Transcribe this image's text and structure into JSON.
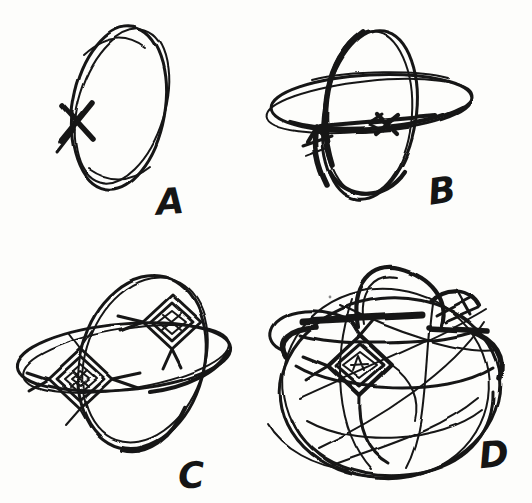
{
  "page": {
    "background_color": "#fdfdfb",
    "ink_color": "#151515"
  },
  "figure": {
    "type": "hand-drawn-sketch-sequence",
    "panels": [
      {
        "id": "A",
        "label": "A"
      },
      {
        "id": "B",
        "label": "B"
      },
      {
        "id": "C",
        "label": "C"
      },
      {
        "id": "D",
        "label": "D"
      }
    ]
  }
}
